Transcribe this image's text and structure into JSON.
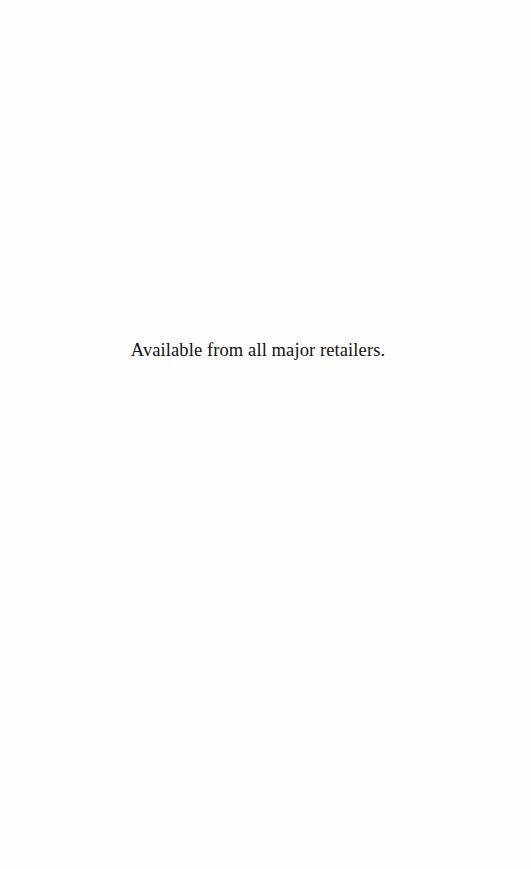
{
  "page": {
    "notice_text": "Available from all major retailers."
  }
}
